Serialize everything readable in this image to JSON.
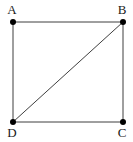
{
  "diagram": {
    "type": "geometry-figure",
    "background_color": "#ffffff",
    "line_color": "#3f3f3f",
    "line_width": 1,
    "dot_color": "#000000",
    "dot_radius": 3,
    "label_color": "#1a1a1a",
    "vertices": [
      {
        "id": "A",
        "label": "A",
        "x": 13,
        "y": 22,
        "label_x": 12,
        "label_y": 14
      },
      {
        "id": "B",
        "label": "B",
        "x": 123,
        "y": 22,
        "label_x": 122,
        "label_y": 14
      },
      {
        "id": "C",
        "label": "C",
        "x": 123,
        "y": 122,
        "label_x": 122,
        "label_y": 137
      },
      {
        "id": "D",
        "label": "D",
        "x": 13,
        "y": 122,
        "label_x": 12,
        "label_y": 137
      }
    ],
    "edges": [
      {
        "from": "A",
        "to": "B",
        "name": "edge-AB"
      },
      {
        "from": "B",
        "to": "C",
        "name": "edge-BC"
      },
      {
        "from": "C",
        "to": "D",
        "name": "edge-CD"
      },
      {
        "from": "D",
        "to": "A",
        "name": "edge-DA"
      },
      {
        "from": "D",
        "to": "B",
        "name": "diagonal-DB"
      }
    ]
  }
}
